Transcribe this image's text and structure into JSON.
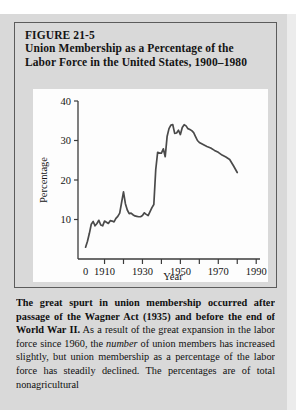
{
  "figure": {
    "number": "FIGURE 21-5",
    "title_line1": "Union Membership as a Percentage of the",
    "title_line2": "Labor Force in the United States, 1900–1980"
  },
  "caption": {
    "lead": "The great spurt in union membership occurred after passage of the Wagner Act (1935) and before the end of World War II.",
    "body_part1": " As a result of the great expansion in the labor force since 1960, the ",
    "emphasis": "number",
    "body_part2": " of union members has increased slightly, but union membership as a percentage of the labor force has steadily declined. The percentages are of total nonagricultural"
  },
  "chart_data": {
    "type": "line",
    "title": "Union Membership as a Percentage of the Labor Force in the United States, 1900–1980",
    "xlabel": "Year",
    "ylabel": "Percentage",
    "xlim": [
      1896,
      1992
    ],
    "ylim": [
      0,
      40
    ],
    "grid": false,
    "legend": null,
    "x_ticks_major": [
      "0",
      "1910",
      "1930",
      "1950",
      "1970",
      "1990"
    ],
    "x_tick_values": [
      1900,
      1910,
      1930,
      1950,
      1970,
      1990
    ],
    "x_ticks_minor": [
      1920,
      1940,
      1960,
      1980
    ],
    "y_ticks": [
      10,
      20,
      30,
      40
    ],
    "line_color": "#4a4a4a",
    "series": [
      {
        "name": "Union membership (% of labor force)",
        "x": [
          1900,
          1901,
          1902,
          1903,
          1904,
          1905,
          1906,
          1907,
          1908,
          1909,
          1910,
          1911,
          1912,
          1913,
          1914,
          1915,
          1916,
          1917,
          1918,
          1919,
          1920,
          1921,
          1922,
          1923,
          1924,
          1925,
          1926,
          1927,
          1928,
          1929,
          1930,
          1931,
          1932,
          1933,
          1934,
          1935,
          1936,
          1937,
          1938,
          1939,
          1940,
          1941,
          1942,
          1943,
          1944,
          1945,
          1946,
          1947,
          1948,
          1949,
          1950,
          1951,
          1952,
          1953,
          1954,
          1955,
          1956,
          1957,
          1958,
          1959,
          1960,
          1962,
          1964,
          1966,
          1968,
          1970,
          1972,
          1974,
          1976,
          1978,
          1980
        ],
        "y": [
          3.0,
          4.5,
          6.5,
          8.8,
          9.5,
          8.4,
          9.0,
          9.8,
          8.6,
          8.4,
          9.6,
          9.3,
          9.0,
          9.7,
          9.6,
          9.4,
          10.3,
          10.8,
          11.6,
          14.3,
          17.0,
          14.0,
          12.4,
          11.5,
          11.6,
          11.2,
          10.9,
          10.8,
          10.7,
          10.7,
          11.0,
          11.7,
          11.3,
          11.0,
          12.0,
          13.0,
          13.8,
          22.6,
          27.0,
          26.8,
          26.8,
          27.9,
          25.9,
          31.0,
          33.0,
          33.9,
          34.0,
          31.8,
          31.9,
          32.6,
          31.5,
          33.3,
          34.0,
          33.7,
          33.0,
          32.8,
          32.5,
          32.0,
          31.0,
          30.0,
          29.5,
          29.0,
          28.5,
          28.1,
          27.5,
          27.0,
          26.3,
          25.8,
          25.2,
          23.6,
          21.9
        ]
      }
    ],
    "annotations": []
  }
}
